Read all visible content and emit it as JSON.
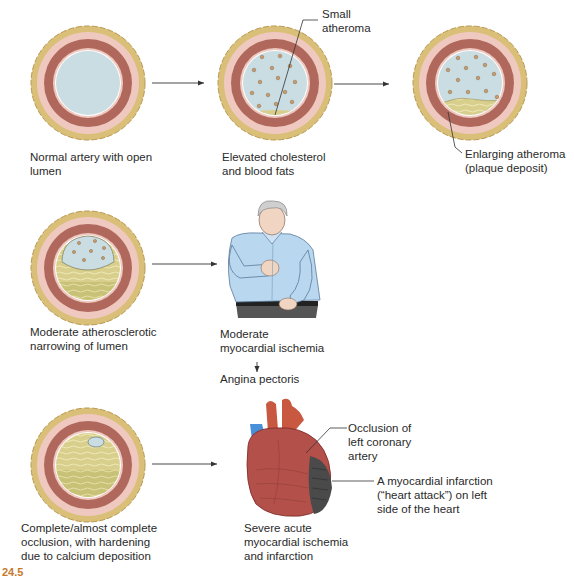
{
  "figure": {
    "stages": [
      {
        "id": "normal",
        "label": "Normal artery with open\nlumen"
      },
      {
        "id": "elevated",
        "label": "Elevated cholesterol\nand blood fats",
        "callout": "Small\natheroma"
      },
      {
        "id": "enlarging",
        "label": "",
        "callout": "Enlarging atheroma\n(plaque deposit)"
      },
      {
        "id": "moderate",
        "label": "Moderate atherosclerotic\nnarrowing of lumen"
      },
      {
        "id": "complete",
        "label": "Complete/almost complete\nocclusion, with hardening\ndue to calcium deposition"
      }
    ],
    "outcomes": {
      "ischemia": {
        "label": "Moderate\nmyocardial ischemia",
        "result": "Angina pectoris"
      },
      "infarction": {
        "label": "Severe acute\nmyocardial ischemia\nand infarction",
        "callout_occlusion": "Occlusion of\nleft coronary\nartery",
        "callout_infarct": "A myocardial infarction\n(“heart attack”) on left\nside of the heart"
      }
    },
    "caption_fragment": {
      "number": "24.5",
      "text": "Progressive atherosclerosis ..."
    }
  },
  "colors": {
    "adventitia": "#d9bf78",
    "adventitia_edge": "#b99a52",
    "intima_pink": "#efc9c0",
    "media_muscle": "#b0685c",
    "lumen": "#c9dde2",
    "plaque": "#d8cf8c",
    "plaque_dark": "#b9b25c",
    "fat_dot": "#c99a6a",
    "shirt": "#b9d7ef",
    "heart": "#b4504a",
    "infarct": "#4a4a4a",
    "vein_blue": "#4a90d9",
    "caption_accent": "#c8782a"
  }
}
